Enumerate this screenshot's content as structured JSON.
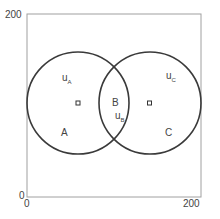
{
  "axes": {
    "y_max_label": "200",
    "y_min_label": "0",
    "x_min_label": "0",
    "x_max_label": "200"
  },
  "regions": {
    "A": "A",
    "B": "B",
    "C": "C"
  },
  "velocities": {
    "uA": {
      "base": "u",
      "sub": "A"
    },
    "uB": {
      "base": "u",
      "sub": "B"
    },
    "uC": {
      "base": "u",
      "sub": "C"
    }
  },
  "colors": {
    "frame": "#9a9a9a",
    "circle": "#3a3a3a",
    "text": "#444444"
  }
}
